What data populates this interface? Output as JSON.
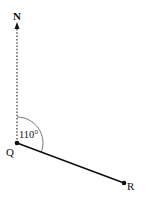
{
  "diagram": {
    "type": "bearing",
    "north_label": "N",
    "point_q_label": "Q",
    "point_r_label": "R",
    "angle_label": "110°",
    "angle_degrees": 110,
    "colors": {
      "line": "#111111",
      "arc": "#555555",
      "north_dotted": "#333333"
    }
  }
}
